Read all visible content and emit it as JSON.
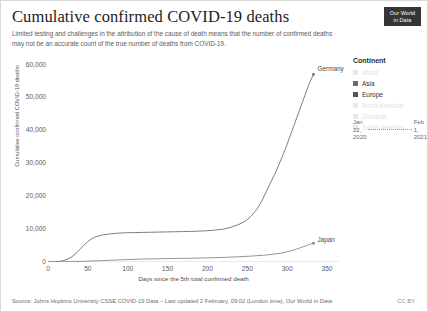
{
  "header": {
    "title": "Cumulative confirmed COVID-19 deaths",
    "subtitle": "Limited testing and challenges in the attribution of the cause of death means that the number of confirmed deaths may not be an accurate count of the true number of deaths from COVID-19.",
    "logo_line1": "Our World",
    "logo_line2": "in Data"
  },
  "legend": {
    "title": "Continent",
    "items": [
      {
        "label": "Africa",
        "active": false,
        "color": "#e8e8e8"
      },
      {
        "label": "Asia",
        "active": true,
        "color": "#6b6b6b"
      },
      {
        "label": "Europe",
        "active": true,
        "color": "#555555"
      },
      {
        "label": "North America",
        "active": false,
        "color": "#e8e8e8"
      },
      {
        "label": "Oceania",
        "active": false,
        "color": "#e8e8e8"
      },
      {
        "label": "South America",
        "active": false,
        "color": "#e8e8e8"
      }
    ]
  },
  "time_slider": {
    "start": "Jan 22, 2020",
    "start_line1": "Jan",
    "start_line2": "22,",
    "start_line3": "2020",
    "end_line1": "Feb",
    "end_line2": "1,",
    "end_line3": "2021"
  },
  "footer": {
    "source": "Source: Johns Hopkins University CSSE COVID-19 Data – Last updated 2 February, 09:02 (London time), Our World in Data",
    "license": "CC BY"
  },
  "chart_data": {
    "type": "line",
    "title": "Cumulative confirmed COVID-19 deaths",
    "subtitle": "Limited testing and challenges in the attribution of the cause of death means that the number of confirmed deaths may not be an accurate count of the true number of deaths from COVID-19.",
    "xlabel": "Days since the 5th total confirmed death",
    "ylabel": "Cumulative confirmed COVID-19 deaths",
    "xlim": [
      0,
      365
    ],
    "ylim": [
      0,
      62000
    ],
    "xticks": [
      0,
      50,
      100,
      150,
      200,
      250,
      300,
      350
    ],
    "xtick_labels": [
      "0",
      "50",
      "100",
      "150",
      "200",
      "250",
      "300",
      "350"
    ],
    "yticks": [
      0,
      10000,
      20000,
      30000,
      40000,
      50000,
      60000
    ],
    "ytick_labels": [
      "0",
      "10,000",
      "20,000",
      "30,000",
      "40,000",
      "50,000",
      "60,000"
    ],
    "grid": false,
    "legend_position": "right",
    "series": [
      {
        "name": "Germany",
        "color": "#6f6f6f",
        "end_label": "Germany",
        "end_value": 57000,
        "x": [
          0,
          5,
          10,
          15,
          20,
          25,
          30,
          35,
          40,
          45,
          50,
          55,
          60,
          70,
          80,
          90,
          100,
          110,
          120,
          130,
          140,
          150,
          160,
          170,
          180,
          190,
          200,
          210,
          220,
          230,
          240,
          248,
          255,
          262,
          268,
          274,
          280,
          286,
          292,
          298,
          304,
          310,
          316,
          322,
          328,
          333
        ],
        "y": [
          5,
          30,
          90,
          220,
          480,
          900,
          1600,
          2600,
          3800,
          5100,
          6200,
          7100,
          7700,
          8300,
          8600,
          8800,
          8900,
          8950,
          9000,
          9050,
          9100,
          9150,
          9200,
          9250,
          9300,
          9400,
          9500,
          9700,
          10000,
          10600,
          11500,
          12500,
          14000,
          16000,
          18500,
          21500,
          24500,
          27500,
          31000,
          34500,
          38500,
          42500,
          46500,
          50500,
          54500,
          57000
        ]
      },
      {
        "name": "Japan",
        "color": "#8a8a8a",
        "end_label": "Japan",
        "end_value": 5700,
        "x": [
          0,
          10,
          20,
          30,
          40,
          50,
          60,
          70,
          80,
          90,
          100,
          120,
          140,
          160,
          180,
          200,
          220,
          240,
          255,
          270,
          282,
          292,
          300,
          308,
          315,
          322,
          328,
          333
        ],
        "y": [
          5,
          25,
          60,
          110,
          180,
          260,
          350,
          450,
          550,
          650,
          750,
          900,
          1000,
          1080,
          1150,
          1250,
          1400,
          1600,
          1800,
          2050,
          2350,
          2700,
          3100,
          3600,
          4200,
          4800,
          5350,
          5700
        ]
      }
    ]
  }
}
